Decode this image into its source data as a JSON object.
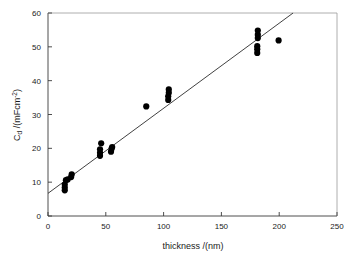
{
  "chart_data": {
    "type": "scatter",
    "title": "",
    "xlabel": "thickness /(nm)",
    "ylabel": "Cd /(mFcm-2)",
    "ylabel_main": "C",
    "ylabel_subscript": "d",
    "ylabel_rest": " /(mFcm",
    "ylabel_superscript": "-2",
    "ylabel_close": ")",
    "xlim": [
      0,
      250
    ],
    "ylim": [
      0,
      60
    ],
    "xticks": [
      0,
      50,
      100,
      150,
      200,
      250
    ],
    "yticks": [
      0,
      10,
      20,
      30,
      40,
      50,
      60
    ],
    "xtick_labels": [
      "0",
      "50",
      "100",
      "150",
      "200",
      "250"
    ],
    "ytick_labels": [
      "0",
      "10",
      "20",
      "30",
      "40",
      "50",
      "60"
    ],
    "grid": false,
    "legend": false,
    "marker": "filled-circle",
    "marker_color": "#000000",
    "points": [
      {
        "x": 14.5,
        "y": 7.6
      },
      {
        "x": 14.5,
        "y": 8.4
      },
      {
        "x": 14.5,
        "y": 9.3
      },
      {
        "x": 15.5,
        "y": 10.6
      },
      {
        "x": 17.0,
        "y": 10.8
      },
      {
        "x": 20.0,
        "y": 11.5
      },
      {
        "x": 20.5,
        "y": 12.3
      },
      {
        "x": 45.0,
        "y": 17.8
      },
      {
        "x": 45.0,
        "y": 18.7
      },
      {
        "x": 45.0,
        "y": 19.7
      },
      {
        "x": 46.0,
        "y": 21.5
      },
      {
        "x": 54.5,
        "y": 19.0
      },
      {
        "x": 55.0,
        "y": 19.9
      },
      {
        "x": 55.5,
        "y": 20.4
      },
      {
        "x": 85.0,
        "y": 32.4
      },
      {
        "x": 104.0,
        "y": 34.3
      },
      {
        "x": 104.0,
        "y": 35.4
      },
      {
        "x": 104.5,
        "y": 36.4
      },
      {
        "x": 104.5,
        "y": 37.4
      },
      {
        "x": 181.0,
        "y": 48.2
      },
      {
        "x": 181.0,
        "y": 49.3
      },
      {
        "x": 181.0,
        "y": 50.2
      },
      {
        "x": 181.5,
        "y": 52.6
      },
      {
        "x": 181.5,
        "y": 53.6
      },
      {
        "x": 181.5,
        "y": 54.8
      },
      {
        "x": 199.5,
        "y": 51.9
      }
    ],
    "trend_line": {
      "type": "linear-fit",
      "x_start": 0,
      "y_start": 6.7,
      "x_end": 212,
      "y_end": 60.0,
      "slope": 0.2514,
      "intercept": 6.7
    }
  }
}
